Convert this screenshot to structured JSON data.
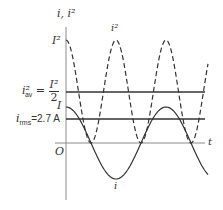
{
  "diagram": {
    "axis_label_y": "i, i²",
    "axis_label_x": "t",
    "origin_label": "O",
    "labels": {
      "I_squared": "I²",
      "i_squared_curve": "i²",
      "i_curve": "i",
      "I_peak": "I",
      "i_av_sq_lhs": "i²",
      "i_av_sub": "av",
      "equals": "=",
      "frac_num": "I²",
      "frac_den": "2",
      "i_rms": "i",
      "i_rms_sub": "rms",
      "i_rms_value": "=2.7 A"
    },
    "levels_px": {
      "t_axis_y": 143,
      "I_y": 107,
      "i_rms_y": 119,
      "i_av_sq_y": 92,
      "I_sq_y": 40
    },
    "colors": {
      "stroke": "#333333",
      "axis": "#8a8a8a"
    }
  }
}
